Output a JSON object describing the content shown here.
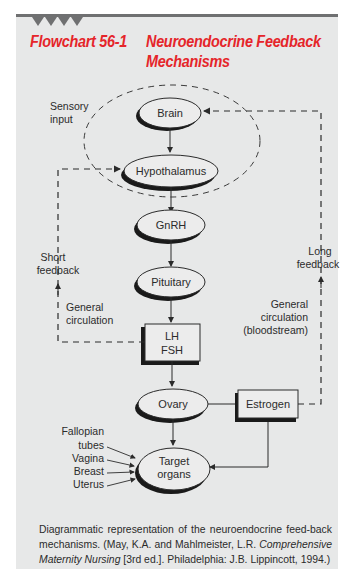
{
  "header": {
    "figure_number": "Flowchart 56-1",
    "title_line1": "Neuroendocrine Feedback",
    "title_line2": "Mechanisms",
    "accent_color": "#e5252a"
  },
  "nodes": {
    "brain": "Brain",
    "hypothalamus": "Hypothalamus",
    "gnrh": "GnRH",
    "pituitary": "Pituitary",
    "lh": "LH",
    "fsh": "FSH",
    "ovary": "Ovary",
    "estrogen": "Estrogen",
    "target_line1": "Target",
    "target_line2": "organs"
  },
  "labels": {
    "sensory_line1": "Sensory",
    "sensory_line2": "input",
    "short_line1": "Short",
    "short_line2": "feedback",
    "gen_left_line1": "General",
    "gen_left_line2": "circulation",
    "long_line1": "Long",
    "long_line2": "feedback",
    "gen_right_line1": "General",
    "gen_right_line2": "circulation",
    "gen_right_line3": "(bloodstream)"
  },
  "target_organs": [
    "Fallopian",
    "tubes",
    "Vagina",
    "Breast",
    "Uterus"
  ],
  "caption": {
    "part1": "Diagrammatic representation of the neuroendocrine feed-back mechanisms. (May, K.A. and Mahlmeister, L.R. ",
    "italic": "Comprehensive Maternity Nursing",
    "part2": " [3rd ed.]. Philadelphia: J.B. Lippincott, 1994.)"
  }
}
